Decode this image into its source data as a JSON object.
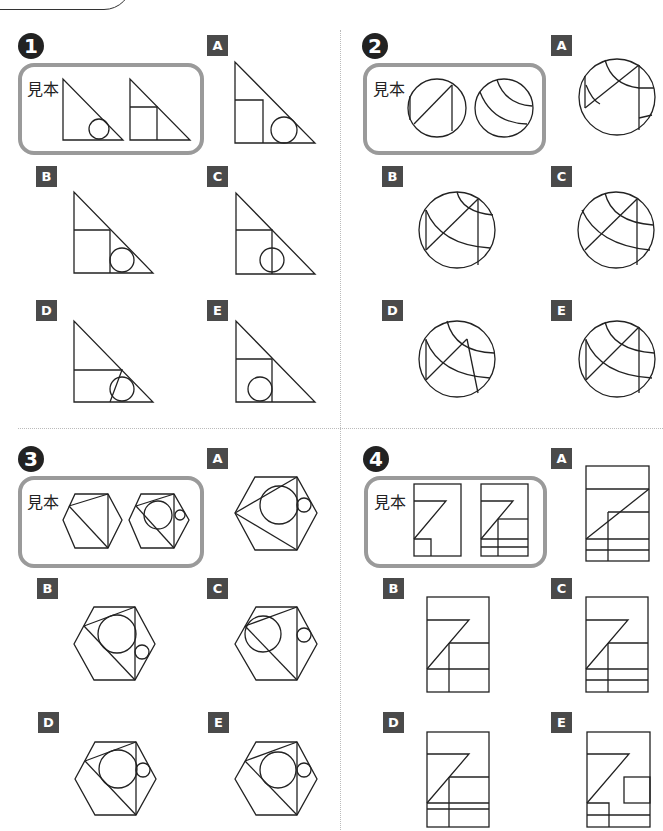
{
  "header_fragment": {
    "visible": true
  },
  "sample_label": "見本",
  "questions": [
    {
      "number": "1",
      "shape": "right-triangle",
      "options": [
        "A",
        "B",
        "C",
        "D",
        "E"
      ]
    },
    {
      "number": "2",
      "shape": "circle",
      "options": [
        "A",
        "B",
        "C",
        "D",
        "E"
      ]
    },
    {
      "number": "3",
      "shape": "hexagon",
      "options": [
        "A",
        "B",
        "C",
        "D",
        "E"
      ]
    },
    {
      "number": "4",
      "shape": "rectangle",
      "options": [
        "A",
        "B",
        "C",
        "D",
        "E"
      ]
    }
  ],
  "colors": {
    "stroke": "#222222",
    "sample_border": "#9a9a9a",
    "label_bg": "#4a4a4a",
    "number_bg": "#222222"
  }
}
